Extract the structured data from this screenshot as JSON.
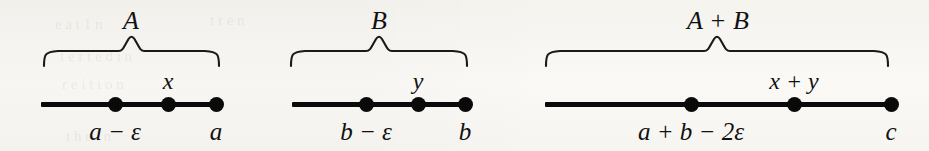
{
  "figure": {
    "background_color": "#f8f7f4",
    "stroke_color": "#0a0a0a",
    "ghost_text": [
      "e a  t 1 n",
      "t   r e   n",
      "t e r  t  e d  i n",
      "r e   i t i o n",
      "t h e   i n"
    ]
  },
  "diagrams": [
    {
      "id": "diagram-a",
      "brace_label": "A",
      "axis": {
        "left": 41,
        "right": 222,
        "y": 102
      },
      "brace": {
        "left": 44,
        "right": 219,
        "top": 38,
        "height": 28
      },
      "brace_label_pos": {
        "x": 131,
        "y": 8
      },
      "points": [
        {
          "name": "point-a-minus-eps",
          "x": 115,
          "label_below": "a − ε",
          "label_above": ""
        },
        {
          "name": "point-x",
          "x": 168,
          "label_below": "",
          "label_above": "x"
        },
        {
          "name": "point-a",
          "x": 216,
          "label_below": "a",
          "label_above": ""
        }
      ]
    },
    {
      "id": "diagram-b",
      "brace_label": "B",
      "axis": {
        "left": 292,
        "right": 470,
        "y": 102
      },
      "brace": {
        "left": 291,
        "right": 467,
        "top": 38,
        "height": 28
      },
      "brace_label_pos": {
        "x": 379,
        "y": 8
      },
      "points": [
        {
          "name": "point-b-minus-eps",
          "x": 366,
          "label_below": "b − ε",
          "label_above": ""
        },
        {
          "name": "point-y",
          "x": 418,
          "label_below": "",
          "label_above": "y"
        },
        {
          "name": "point-b",
          "x": 465,
          "label_below": "b",
          "label_above": ""
        }
      ]
    },
    {
      "id": "diagram-a-plus-b",
      "brace_label": "A + B",
      "axis": {
        "left": 545,
        "right": 895,
        "y": 102
      },
      "brace": {
        "left": 546,
        "right": 888,
        "top": 38,
        "height": 28
      },
      "brace_label_pos": {
        "x": 718,
        "y": 8
      },
      "points": [
        {
          "name": "point-a-plus-b-minus-2eps",
          "x": 691,
          "label_below": "a + b − 2ε",
          "label_above": ""
        },
        {
          "name": "point-x-plus-y",
          "x": 794,
          "label_below": "",
          "label_above": "x + y"
        },
        {
          "name": "point-c",
          "x": 891,
          "label_below": "c",
          "label_above": ""
        }
      ]
    }
  ]
}
